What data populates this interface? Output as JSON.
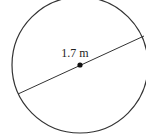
{
  "diagram": {
    "shape": "circle",
    "center": {
      "x": 80,
      "y": 65
    },
    "radius": 68,
    "diameter_line": {
      "x1": 18,
      "y1": 94,
      "x2": 144,
      "y2": 36
    },
    "measurement_label": "1.7 m",
    "stroke_color": "#333333",
    "background_color": "#ffffff"
  }
}
